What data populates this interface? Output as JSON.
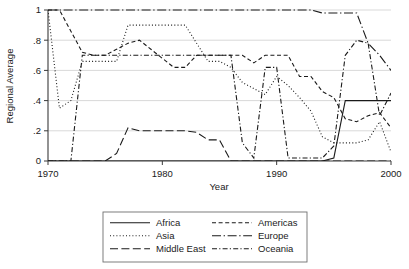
{
  "chart_data": {
    "type": "line",
    "title": "",
    "xlabel": "Year",
    "ylabel": "Regional Average",
    "xlim": [
      1970,
      2000
    ],
    "ylim": [
      0,
      1
    ],
    "grid": true,
    "legend_position": "below",
    "xticks": [
      1970,
      1980,
      1990,
      2000
    ],
    "xtick_labels": [
      "1970",
      "1980",
      "1990",
      "2000"
    ],
    "yticks": [
      0,
      0.2,
      0.4,
      0.6,
      0.8,
      1
    ],
    "ytick_labels": [
      "0",
      ".2",
      ".4",
      ".6",
      ".8",
      "1"
    ],
    "series": [
      {
        "name": "Africa",
        "style": "solid",
        "x": [
          1970,
          1971,
          1972,
          1973,
          1974,
          1975,
          1976,
          1977,
          1978,
          1979,
          1980,
          1981,
          1982,
          1983,
          1984,
          1985,
          1986,
          1987,
          1988,
          1989,
          1990,
          1991,
          1992,
          1993,
          1994,
          1995,
          1996,
          1997,
          1998,
          1999,
          2000
        ],
        "y": [
          0,
          0,
          0,
          0,
          0,
          0,
          0,
          0,
          0,
          0,
          0,
          0,
          0,
          0,
          0,
          0,
          0,
          0,
          0,
          0,
          0,
          0,
          0,
          0,
          0,
          0.02,
          0.4,
          0.4,
          0.4,
          0.4,
          0.4
        ]
      },
      {
        "name": "Asia",
        "style": "dotted",
        "x": [
          1970,
          1971,
          1972,
          1973,
          1974,
          1975,
          1976,
          1977,
          1978,
          1979,
          1980,
          1981,
          1982,
          1983,
          1984,
          1985,
          1986,
          1987,
          1988,
          1989,
          1990,
          1991,
          1992,
          1993,
          1994,
          1995,
          1996,
          1997,
          1998,
          1999,
          2000
        ],
        "y": [
          1.0,
          0.35,
          0.4,
          0.66,
          0.66,
          0.66,
          0.66,
          0.9,
          0.9,
          0.9,
          0.9,
          0.9,
          0.9,
          0.78,
          0.66,
          0.66,
          0.62,
          0.52,
          0.48,
          0.44,
          0.56,
          0.5,
          0.42,
          0.33,
          0.16,
          0.12,
          0.12,
          0.12,
          0.14,
          0.26,
          0.06
        ]
      },
      {
        "name": "Middle East",
        "style": "longdash",
        "x": [
          1970,
          1971,
          1972,
          1973,
          1974,
          1975,
          1976,
          1977,
          1978,
          1979,
          1980,
          1981,
          1982,
          1983,
          1984,
          1985,
          1986,
          1987,
          1988,
          1989,
          1990,
          1991,
          1992,
          1993,
          1994,
          1995,
          1996,
          1997,
          1998,
          1999,
          2000
        ],
        "y": [
          0,
          0,
          0,
          0,
          0,
          0,
          0.05,
          0.22,
          0.2,
          0.2,
          0.2,
          0.2,
          0.2,
          0.19,
          0.14,
          0.14,
          0.0,
          0,
          0,
          0,
          0,
          0,
          0,
          0,
          0,
          0,
          0,
          0,
          0,
          0,
          0
        ]
      },
      {
        "name": "Americas",
        "style": "dash",
        "x": [
          1970,
          1971,
          1972,
          1973,
          1974,
          1975,
          1976,
          1977,
          1978,
          1979,
          1980,
          1981,
          1982,
          1983,
          1984,
          1985,
          1986,
          1987,
          1988,
          1989,
          1990,
          1991,
          1992,
          1993,
          1994,
          1995,
          1996,
          1997,
          1998,
          1999,
          2000
        ],
        "y": [
          1.0,
          1.0,
          0.86,
          0.72,
          0.7,
          0.7,
          0.74,
          0.78,
          0.8,
          0.74,
          0.68,
          0.62,
          0.62,
          0.7,
          0.7,
          0.7,
          0.7,
          0.7,
          0.65,
          0.7,
          0.7,
          0.7,
          0.56,
          0.56,
          0.46,
          0.42,
          0.28,
          0.26,
          0.3,
          0.32,
          0.22
        ]
      },
      {
        "name": "Europe",
        "style": "dashdotlong",
        "x": [
          1970,
          1971,
          1972,
          1973,
          1974,
          1975,
          1976,
          1977,
          1978,
          1979,
          1980,
          1981,
          1982,
          1983,
          1984,
          1985,
          1986,
          1987,
          1988,
          1989,
          1990,
          1991,
          1992,
          1993,
          1994,
          1995,
          1996,
          1997,
          1998,
          1999,
          2000
        ],
        "y": [
          1.0,
          1.0,
          1.0,
          1.0,
          1.0,
          1.0,
          1.0,
          1.0,
          1.0,
          1.0,
          1.0,
          1.0,
          1.0,
          1.0,
          1.0,
          1.0,
          1.0,
          1.0,
          1.0,
          1.0,
          1.0,
          1.0,
          1.0,
          1.0,
          0.98,
          0.98,
          0.98,
          0.98,
          0.78,
          0.7,
          0.6
        ]
      },
      {
        "name": "Oceania",
        "style": "dashdot",
        "x": [
          1970,
          1971,
          1972,
          1973,
          1974,
          1975,
          1976,
          1977,
          1978,
          1979,
          1980,
          1981,
          1982,
          1983,
          1984,
          1985,
          1986,
          1987,
          1988,
          1989,
          1990,
          1991,
          1992,
          1993,
          1994,
          1995,
          1996,
          1997,
          1998,
          1999,
          2000
        ],
        "y": [
          0.0,
          0.0,
          0.0,
          0.7,
          0.7,
          0.7,
          0.7,
          0.7,
          0.7,
          0.7,
          0.7,
          0.7,
          0.7,
          0.7,
          0.7,
          0.7,
          0.7,
          0.12,
          0.02,
          0.62,
          0.62,
          0.02,
          0.02,
          0.02,
          0.02,
          0.1,
          0.7,
          0.8,
          0.78,
          0.3,
          0.45
        ]
      }
    ]
  },
  "legend": {
    "entries": [
      {
        "label": "Africa",
        "style": "solid"
      },
      {
        "label": "Americas",
        "style": "dash"
      },
      {
        "label": "Asia",
        "style": "dotted"
      },
      {
        "label": "Europe",
        "style": "dashdotlong"
      },
      {
        "label": "Middle East",
        "style": "longdash"
      },
      {
        "label": "Oceania",
        "style": "dashdot"
      }
    ]
  }
}
